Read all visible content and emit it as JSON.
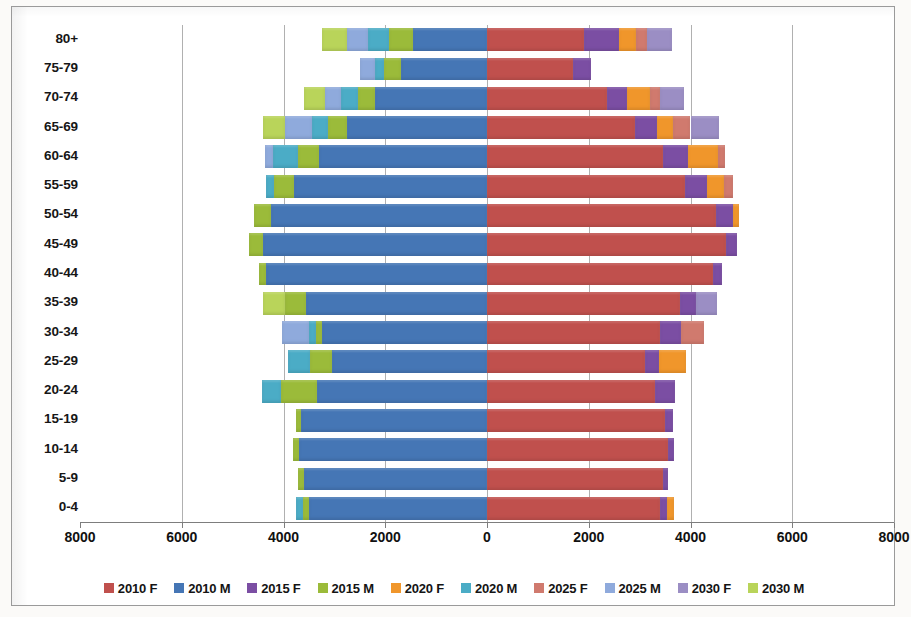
{
  "chart_data": {
    "type": "bar",
    "subtype": "population-pyramid-stacked",
    "title": "",
    "xlabel": "",
    "ylabel": "",
    "xlim": [
      -8000,
      8000
    ],
    "xticks": [
      -8000,
      -6000,
      -4000,
      -2000,
      0,
      2000,
      4000,
      6000,
      8000
    ],
    "xtick_labels": [
      "8000",
      "6000",
      "4000",
      "2000",
      "0",
      "2000",
      "4000",
      "6000",
      "8000"
    ],
    "grid": true,
    "legend_position": "bottom",
    "categories": [
      "80+",
      "75-79",
      "70-74",
      "65-69",
      "60-64",
      "55-59",
      "50-54",
      "45-49",
      "40-44",
      "35-39",
      "30-34",
      "25-29",
      "20-24",
      "15-19",
      "10-14",
      "5-9",
      "0-4"
    ],
    "series": [
      {
        "name": "2010 F",
        "side": "right",
        "color": "#c0504d",
        "values": [
          1900,
          1700,
          2350,
          2900,
          3450,
          3900,
          4500,
          4700,
          4450,
          3800,
          3400,
          3100,
          3300,
          3500,
          3550,
          3450,
          3400
        ]
      },
      {
        "name": "2015 F",
        "side": "right",
        "color": "#7b4ea3",
        "values": [
          700,
          350,
          400,
          450,
          500,
          420,
          330,
          220,
          170,
          300,
          420,
          280,
          400,
          150,
          120,
          110,
          130
        ]
      },
      {
        "name": "2020 F",
        "side": "right",
        "color": "#f0962b",
        "values": [
          330,
          0,
          450,
          300,
          600,
          330,
          120,
          0,
          0,
          0,
          0,
          530,
          0,
          0,
          0,
          0,
          150
        ]
      },
      {
        "name": "2025 F",
        "side": "right",
        "color": "#d07a6e",
        "values": [
          220,
          0,
          200,
          350,
          130,
          180,
          0,
          0,
          0,
          0,
          450,
          0,
          0,
          0,
          0,
          0,
          0
        ]
      },
      {
        "name": "2030 F",
        "side": "right",
        "color": "#9b8ec4",
        "values": [
          480,
          0,
          480,
          560,
          0,
          0,
          0,
          0,
          0,
          430,
          0,
          0,
          0,
          0,
          0,
          0,
          0
        ]
      },
      {
        "name": "2010 M",
        "side": "left",
        "color": "#4576b5",
        "values": [
          1450,
          1700,
          2200,
          2750,
          3300,
          3800,
          4250,
          4400,
          4350,
          3550,
          3250,
          3050,
          3350,
          3650,
          3700,
          3600,
          3500
        ]
      },
      {
        "name": "2015 M",
        "side": "left",
        "color": "#9bbb3a",
        "values": [
          480,
          330,
          330,
          380,
          420,
          380,
          330,
          280,
          130,
          420,
          120,
          420,
          700,
          100,
          110,
          110,
          120
        ]
      },
      {
        "name": "2020 M",
        "side": "left",
        "color": "#4bacc6",
        "values": [
          400,
          170,
          330,
          300,
          480,
          170,
          0,
          0,
          0,
          0,
          130,
          450,
          380,
          0,
          0,
          0,
          130
        ]
      },
      {
        "name": "2025 M",
        "side": "left",
        "color": "#8faadc",
        "values": [
          430,
          300,
          330,
          550,
          170,
          0,
          0,
          0,
          0,
          0,
          520,
          0,
          0,
          0,
          0,
          0,
          0
        ]
      },
      {
        "name": "2030 M",
        "side": "left",
        "color": "#b9d45a",
        "values": [
          480,
          0,
          400,
          430,
          0,
          0,
          0,
          0,
          0,
          430,
          0,
          0,
          0,
          0,
          0,
          0,
          0
        ]
      }
    ]
  },
  "legend": {
    "items": [
      {
        "label": "2010 F",
        "color": "#c0504d"
      },
      {
        "label": "2010 M",
        "color": "#4576b5"
      },
      {
        "label": "2015 F",
        "color": "#7b4ea3"
      },
      {
        "label": "2015 M",
        "color": "#9bbb3a"
      },
      {
        "label": "2020 F",
        "color": "#f0962b"
      },
      {
        "label": "2020 M",
        "color": "#4bacc6"
      },
      {
        "label": "2025 F",
        "color": "#d07a6e"
      },
      {
        "label": "2025 M",
        "color": "#8faadc"
      },
      {
        "label": "2030 F",
        "color": "#9b8ec4"
      },
      {
        "label": "2030 M",
        "color": "#b9d45a"
      }
    ]
  }
}
